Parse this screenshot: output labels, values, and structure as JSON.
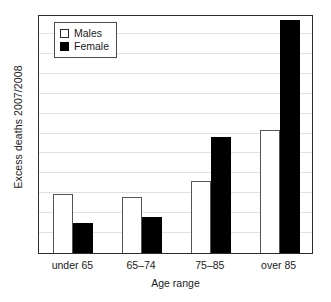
{
  "chart_data": {
    "type": "bar",
    "title": "",
    "xlabel": "Age range",
    "ylabel": "Excess deaths 2007/2008",
    "categories": [
      "under 65",
      "65–74",
      "75–85",
      "over 85"
    ],
    "series": [
      {
        "name": "Males",
        "color": "#ffffff",
        "values": [
          0.247,
          0.234,
          0.301,
          0.515
        ]
      },
      {
        "name": "Female",
        "color": "#000000",
        "values": [
          0.126,
          0.151,
          0.485,
          0.975
        ]
      }
    ],
    "ylim": [
      0,
      1
    ],
    "y_tick_labels": [],
    "grid": true,
    "gridlines": [
      0.083,
      0.167,
      0.25,
      0.333,
      0.417,
      0.5,
      0.583,
      0.667,
      0.75,
      0.833,
      0.917
    ],
    "legend_position": "top-left",
    "legend_entries": [
      "Males",
      "Female"
    ],
    "note": "Y axis is unlabelled – values are relative bar heights as fractions of the plot height."
  },
  "axes": {
    "y_title": "Excess deaths 2007/2008",
    "x_title": "Age range"
  },
  "legend": {
    "males_label": "Males",
    "female_label": "Female"
  },
  "x_labels": {
    "c0": "under 65",
    "c1": "65–74",
    "c2": "75–85",
    "c3": "over 85"
  }
}
